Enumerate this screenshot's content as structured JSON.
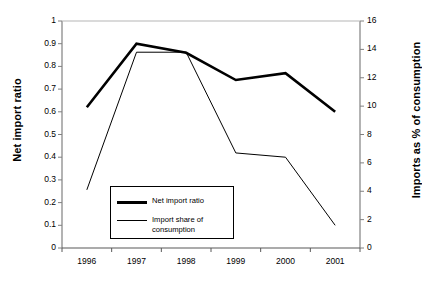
{
  "chart_data": {
    "type": "line",
    "title": "",
    "xlabel": "",
    "ylabel": "Net import ratio",
    "y2label": "Imports as % of consumption",
    "categories": [
      "1996",
      "1997",
      "1998",
      "1999",
      "2000",
      "2001"
    ],
    "ylim": [
      0,
      1
    ],
    "y2lim": [
      0,
      16
    ],
    "yticks": [
      "0",
      "0.1",
      "0.2",
      "0.3",
      "0.4",
      "0.5",
      "0.6",
      "0.7",
      "0.8",
      "0.9",
      "1"
    ],
    "y2ticks": [
      "0",
      "2",
      "4",
      "6",
      "8",
      "10",
      "12",
      "14",
      "16"
    ],
    "grid": false,
    "legend_position": "inside-lower-left",
    "series": [
      {
        "name": "Net import ratio",
        "axis": "left",
        "style": "thick",
        "color": "#000000",
        "values": [
          0.62,
          0.9,
          0.86,
          0.74,
          0.77,
          0.6
        ]
      },
      {
        "name": "Import share of consumption",
        "axis": "right",
        "style": "thin",
        "color": "#000000",
        "values": [
          4.1,
          13.8,
          13.8,
          6.7,
          6.4,
          1.6
        ]
      }
    ]
  },
  "axes": {
    "left_title": "Net import ratio",
    "right_title": "Imports as % of consumption"
  },
  "legend": {
    "entries": [
      {
        "label": "Net import ratio"
      },
      {
        "label": "Import share of\nconsumption"
      }
    ]
  }
}
